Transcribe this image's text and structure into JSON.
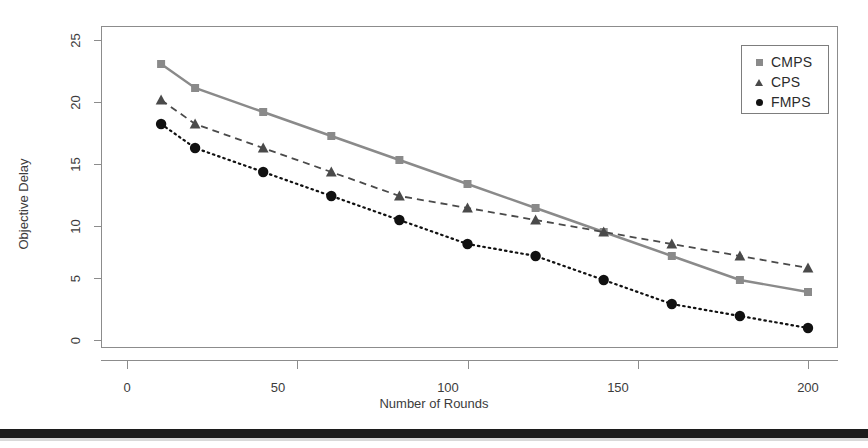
{
  "chart_data": {
    "type": "line",
    "title": "",
    "xlabel": "Number of Rounds",
    "ylabel": "Objective Delay",
    "x": [
      10,
      20,
      40,
      60,
      80,
      100,
      120,
      140,
      160,
      180,
      200
    ],
    "xlim": [
      0,
      210
    ],
    "ylim": [
      0,
      26
    ],
    "xticks": [
      0,
      50,
      100,
      150,
      200
    ],
    "yticks": [
      0,
      5,
      10,
      15,
      20,
      25
    ],
    "grid": false,
    "legend_position": "top-right",
    "series": [
      {
        "name": "CMPS",
        "marker": "square",
        "linestyle": "solid",
        "color": "#8a8a8a",
        "values": [
          23,
          21,
          19,
          17,
          15,
          13,
          11,
          9,
          7,
          5,
          4
        ]
      },
      {
        "name": "CPS",
        "marker": "triangle",
        "linestyle": "dashed",
        "color": "#4a4a4a",
        "values": [
          20,
          18,
          16,
          14,
          12,
          11,
          10,
          9,
          8,
          7,
          6
        ]
      },
      {
        "name": "FMPS",
        "marker": "circle",
        "linestyle": "dotted",
        "color": "#111111",
        "values": [
          18,
          16,
          14,
          12,
          10,
          8,
          7,
          5,
          3,
          2,
          1
        ]
      }
    ]
  },
  "axes": {
    "y_title": "Objective Delay",
    "x_title": "Number of Rounds",
    "y_tick_labels": [
      "25",
      "20",
      "15",
      "10",
      "5",
      "0"
    ],
    "x_tick_labels": [
      "0",
      "50",
      "100",
      "150",
      "200"
    ]
  },
  "legend": {
    "entries": [
      {
        "label": "CMPS",
        "glyph": "square-marker-icon"
      },
      {
        "label": "CPS",
        "glyph": "triangle-marker-icon"
      },
      {
        "label": "FMPS",
        "glyph": "circle-marker-icon"
      }
    ]
  },
  "colors": {
    "cmps": "#8a8a8a",
    "cps": "#4a4a4a",
    "fmps": "#111111",
    "frame": "#8c8c8c",
    "band": "#1c1c1c"
  }
}
